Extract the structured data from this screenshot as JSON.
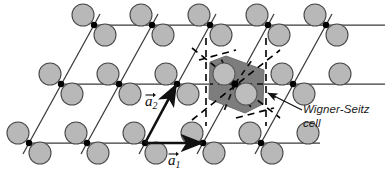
{
  "figure": {
    "name": "two-dimensional-bravais-lattice-with-two-atom-basis"
  },
  "annotations": {
    "wigner_seitz_line1": "Wigner-Seitz",
    "wigner_seitz_line2": "cell",
    "vector_a1_symbol": "a",
    "vector_a1_subscript": "1",
    "vector_a2_symbol": "a",
    "vector_a2_subscript": "2"
  },
  "colors": {
    "atom_fill": "#b8b8b8",
    "atom_stroke": "#4a4a4a",
    "lattice_line": "#3a3a3a",
    "node_dot": "#000000",
    "wigner_seitz_fill": "#7d7d7d",
    "dashed_line": "#000000",
    "label_text": "#1a1a1a",
    "background": "#ffffff"
  },
  "geometry": {
    "lattice_vector_a1": {
      "dx": 58,
      "dy": 0
    },
    "lattice_vector_a2": {
      "dx": 32,
      "dy": -59
    },
    "atom_radius": 11,
    "node_radius": 3.2,
    "rows": [
      {
        "name": "top-row",
        "y": 25,
        "x_start": 94
      },
      {
        "name": "middle-row",
        "y": 84,
        "x_start": 61
      },
      {
        "name": "bottom-row",
        "y": 143,
        "x_start": 29
      }
    ],
    "columns_per_row": 5,
    "wigner_seitz_center": {
      "x": 235,
      "y": 84
    },
    "wigner_seitz_vertices": [
      {
        "x": 210,
        "y": 62
      },
      {
        "x": 226,
        "y": 56
      },
      {
        "x": 264,
        "y": 70
      },
      {
        "x": 263,
        "y": 104
      },
      {
        "x": 245,
        "y": 113
      },
      {
        "x": 209,
        "y": 99
      }
    ],
    "leader_line": {
      "from": {
        "x": 300,
        "y": 112
      },
      "to": {
        "x": 266,
        "y": 93
      }
    }
  },
  "label_positions": {
    "wigner_seitz": {
      "x": 303,
      "y": 103
    },
    "vector_a1": {
      "x": 168,
      "y": 156
    },
    "vector_a2": {
      "x": 145,
      "y": 97
    }
  }
}
